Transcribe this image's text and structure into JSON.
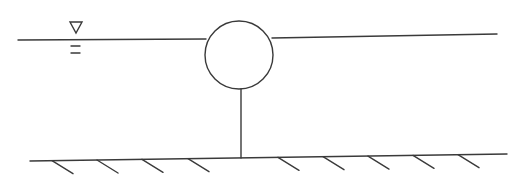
{
  "diagram": {
    "title": "",
    "colors": {
      "ink": "#3a3a3a",
      "background": "#ffffff"
    },
    "free_surface": {
      "symbol": "water-level-triangle-icon",
      "left_segment": {
        "x1": 18,
        "y1": 40,
        "x2": 206,
        "y2": 39
      },
      "right_segment": {
        "x1": 272,
        "y1": 38,
        "x2": 497,
        "y2": 34
      },
      "marker": {
        "triangle_x": 76,
        "triangle_y": 28,
        "dash_lines": [
          {
            "x1": 71,
            "x2": 80,
            "y": 46
          },
          {
            "x1": 71,
            "x2": 80,
            "y": 53
          }
        ]
      }
    },
    "buoy": {
      "shape": "circle",
      "cx": 239,
      "cy": 55,
      "r": 34
    },
    "tether": {
      "x1": 241,
      "y1": 89,
      "x2": 241,
      "y2": 158
    },
    "ground": {
      "line": {
        "x1": 30,
        "y1": 161,
        "x2": 507,
        "y2": 154
      },
      "hatch_starts_x": [
        52,
        97,
        142,
        188,
        278,
        323,
        368,
        413,
        458
      ],
      "hatch_dx": 21,
      "hatch_dy": 13
    }
  }
}
